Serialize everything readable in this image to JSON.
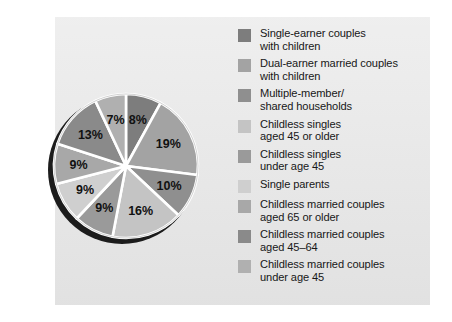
{
  "panel": {
    "background_color": "#e6e6e6"
  },
  "chart_data": {
    "type": "pie",
    "title": "",
    "subtitle": "",
    "xlabel": "",
    "ylabel": "",
    "legend_position": "right",
    "grid": false,
    "start_angle_deg": 0,
    "direction": "clockwise",
    "total": 100,
    "value_suffix": "%",
    "categories": [
      "Single-earner couples with children",
      "Dual-earner married couples with children",
      "Multiple-member/ shared households",
      "Childless singles aged 45 or older",
      "Childless singles under age 45",
      "Single parents",
      "Childless married couples aged 65 or older",
      "Childless married couples aged 45–64",
      "Childless married couples under age 45"
    ],
    "values": [
      8,
      19,
      10,
      16,
      9,
      9,
      9,
      13,
      7
    ],
    "labels": [
      "8%",
      "19%",
      "10%",
      "16%",
      "9%",
      "9%",
      "9%",
      "13%",
      "7%"
    ],
    "colors": [
      "#7d7d7d",
      "#a3a3a3",
      "#8f8f8f",
      "#c4c4c4",
      "#9a9a9a",
      "#cfcfcf",
      "#a8a8a8",
      "#8a8a8a",
      "#b0b0b0"
    ],
    "slice_divider_color": "#ffffff",
    "shadow_color": "#1c1c1c",
    "label_color": "#111111"
  },
  "pie": {
    "slices": [
      {
        "label": "8%",
        "value": 8,
        "color": "#7d7d7d",
        "label_x": 141,
        "label_y": 100
      },
      {
        "label": "19%",
        "value": 19,
        "color": "#a3a3a3",
        "label_x": 184,
        "label_y": 134
      },
      {
        "label": "10%",
        "value": 10,
        "color": "#8f8f8f",
        "label_x": 185,
        "label_y": 196
      },
      {
        "label": "16%",
        "value": 16,
        "color": "#c4c4c4",
        "label_x": 143,
        "label_y": 237
      },
      {
        "label": "9%",
        "value": 9,
        "color": "#9a9a9a",
        "label_x": 89,
        "label_y": 233
      },
      {
        "label": "9%",
        "value": 9,
        "color": "#cfcfcf",
        "label_x": 62,
        "label_y": 203
      },
      {
        "label": "9%",
        "value": 9,
        "color": "#a8a8a8",
        "label_x": 53,
        "label_y": 161
      },
      {
        "label": "13%",
        "value": 13,
        "color": "#8a8a8a",
        "label_x": 71,
        "label_y": 116
      },
      {
        "label": "7%",
        "value": 7,
        "color": "#b0b0b0",
        "label_x": 113,
        "label_y": 96
      }
    ]
  },
  "legend": {
    "items": [
      {
        "label": "Single-earner couples\nwith children",
        "color": "#7d7d7d"
      },
      {
        "label": "Dual-earner married couples\nwith children",
        "color": "#a3a3a3"
      },
      {
        "label": "Multiple-member/\nshared households",
        "color": "#8f8f8f"
      },
      {
        "label": "Childless singles\naged 45 or older",
        "color": "#c4c4c4"
      },
      {
        "label": "Childless singles\nunder age 45",
        "color": "#9a9a9a"
      },
      {
        "label": "Single parents",
        "color": "#cfcfcf"
      },
      {
        "label": "Childless married couples\naged 65 or older",
        "color": "#a8a8a8"
      },
      {
        "label": "Childless married couples\naged 45–64",
        "color": "#8a8a8a"
      },
      {
        "label": "Childless married couples\nunder age 45",
        "color": "#b0b0b0"
      }
    ]
  }
}
